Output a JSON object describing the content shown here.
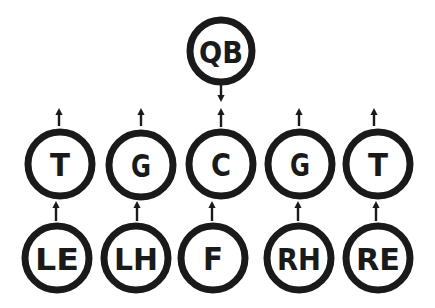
{
  "diagram": {
    "type": "football-formation",
    "colors": {
      "stroke": "#1a1a1a",
      "background": "#ffffff"
    },
    "players": [
      {
        "id": "qb",
        "label": "QB",
        "cx": 221,
        "cy": 51,
        "r": 31
      },
      {
        "id": "lt",
        "label": "T",
        "cx": 60,
        "cy": 164,
        "r": 32
      },
      {
        "id": "lg",
        "label": "G",
        "cx": 141,
        "cy": 165,
        "r": 32
      },
      {
        "id": "c",
        "label": "C",
        "cx": 221,
        "cy": 164,
        "r": 32
      },
      {
        "id": "rg",
        "label": "G",
        "cx": 300,
        "cy": 164,
        "r": 32
      },
      {
        "id": "rt",
        "label": "T",
        "cx": 378,
        "cy": 164,
        "r": 32
      },
      {
        "id": "le",
        "label": "LE",
        "cx": 57,
        "cy": 258,
        "r": 32
      },
      {
        "id": "lh",
        "label": "LH",
        "cx": 136,
        "cy": 258,
        "r": 32
      },
      {
        "id": "f",
        "label": "F",
        "cx": 213,
        "cy": 258,
        "r": 32
      },
      {
        "id": "rh",
        "label": "RH",
        "cx": 299,
        "cy": 258,
        "r": 32
      },
      {
        "id": "re",
        "label": "RE",
        "cx": 378,
        "cy": 258,
        "r": 32
      }
    ],
    "arrows": [
      {
        "from": "qb",
        "direction": "down",
        "x": 221,
        "y1": 84,
        "y2": 102
      },
      {
        "from": "lt",
        "direction": "up",
        "x": 59,
        "y1": 126,
        "y2": 108
      },
      {
        "from": "lg",
        "direction": "up",
        "x": 141,
        "y1": 126,
        "y2": 108
      },
      {
        "from": "c",
        "direction": "up",
        "x": 221,
        "y1": 127,
        "y2": 108
      },
      {
        "from": "rg",
        "direction": "up",
        "x": 299,
        "y1": 126,
        "y2": 108
      },
      {
        "from": "rt",
        "direction": "up",
        "x": 374,
        "y1": 126,
        "y2": 108
      },
      {
        "from": "le",
        "direction": "up",
        "x": 56,
        "y1": 221,
        "y2": 201
      },
      {
        "from": "lh",
        "direction": "up",
        "x": 137,
        "y1": 221,
        "y2": 201
      },
      {
        "from": "f",
        "direction": "up",
        "x": 212,
        "y1": 221,
        "y2": 201
      },
      {
        "from": "rh",
        "direction": "up",
        "x": 298,
        "y1": 221,
        "y2": 201
      },
      {
        "from": "re",
        "direction": "up",
        "x": 376,
        "y1": 221,
        "y2": 201
      }
    ]
  }
}
